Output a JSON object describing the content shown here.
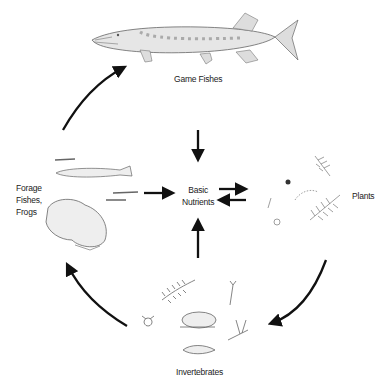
{
  "diagram": {
    "type": "nutrient cycle / food web",
    "nodes": {
      "game_fishes": {
        "label": "Game Fishes",
        "icon": "pike-fish-icon"
      },
      "forage": {
        "label_lines": [
          "Forage",
          "Fishes,",
          "Frogs"
        ],
        "icon": "minnows-and-frog-icon"
      },
      "nutrients": {
        "label_lines": [
          "Basic",
          "Nutrients"
        ]
      },
      "plants": {
        "label": "Plants",
        "icon": "aquatic-plants-icon"
      },
      "invertebrates": {
        "label": "Invertebrates",
        "icon": "invertebrates-icon"
      }
    },
    "edges": [
      {
        "from": "Forage Fishes, Frogs",
        "to": "Game Fishes",
        "style": "curved"
      },
      {
        "from": "Game Fishes",
        "to": "Basic Nutrients",
        "style": "straight"
      },
      {
        "from": "Forage Fishes, Frogs",
        "to": "Basic Nutrients",
        "style": "straight"
      },
      {
        "from": "Invertebrates",
        "to": "Basic Nutrients",
        "style": "straight"
      },
      {
        "from": "Basic Nutrients",
        "to": "Plants",
        "style": "straight"
      },
      {
        "from": "Plants",
        "to": "Basic Nutrients",
        "style": "straight"
      },
      {
        "from": "Plants",
        "to": "Invertebrates",
        "style": "curved"
      },
      {
        "from": "Invertebrates",
        "to": "Forage Fishes, Frogs",
        "style": "curved"
      }
    ],
    "colors": {
      "arrow": "#111111",
      "drawing": "#555555",
      "text": "#222222"
    }
  }
}
